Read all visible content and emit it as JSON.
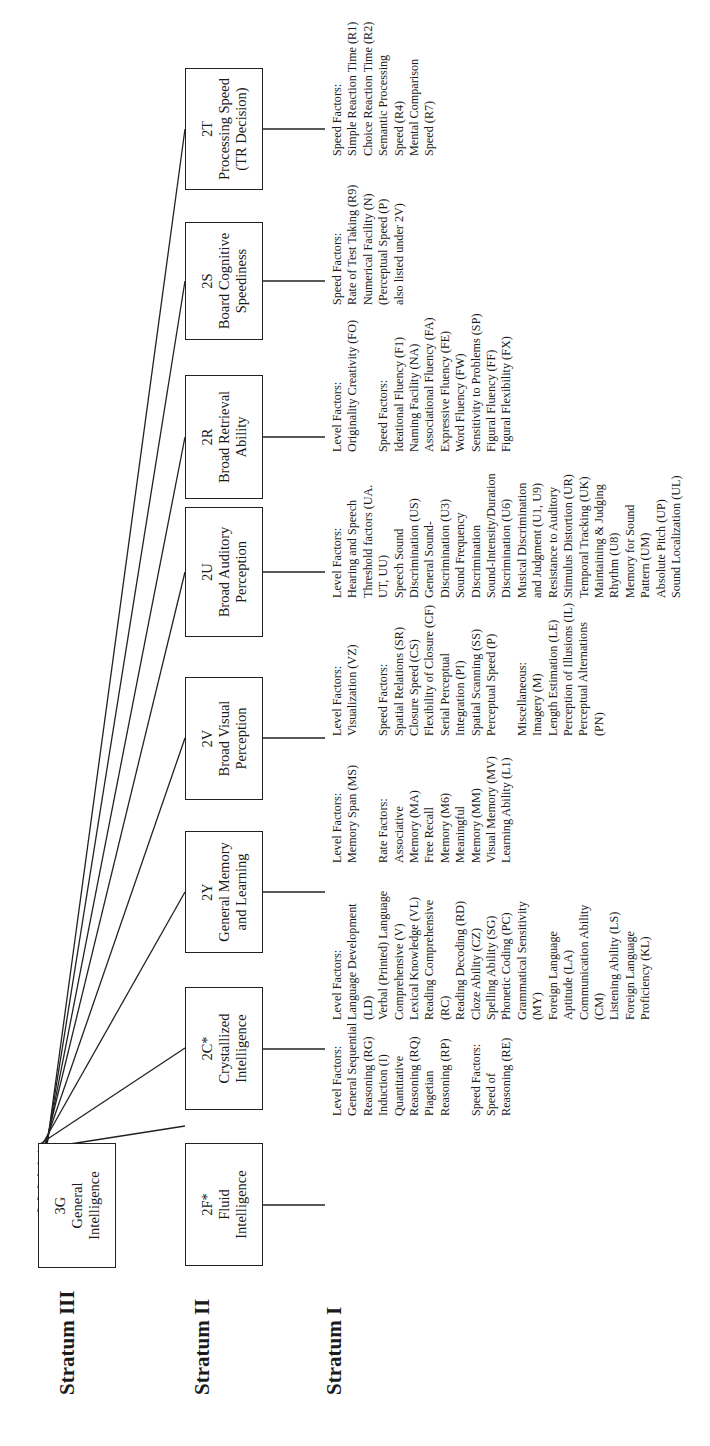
{
  "strata": {
    "stratum_3": "Stratum III",
    "stratum_2": "Stratum II",
    "stratum_1": "Stratum I"
  },
  "general": {
    "code": "3G",
    "line1": "General",
    "line2": "Intelligence"
  },
  "broad_factors": [
    {
      "code": "2F*",
      "title_lines": [
        "Fluid",
        "Intelligence"
      ],
      "groups": [
        {
          "heading": "Level Factors:",
          "lines": [
            "General Sequential",
            "Reasoning (RG)",
            "Induction (I)",
            "Quantitative",
            "Reasoning (RQ)",
            "Piagetian",
            "Reasoning (RP)"
          ]
        },
        {
          "heading": "Speed Factors:",
          "lines": [
            "Speed of",
            "Reasoning (RE)"
          ]
        }
      ]
    },
    {
      "code": "2C*",
      "title_lines": [
        "Crystallized",
        "Intelligence"
      ],
      "groups": [
        {
          "heading": "Level Factors:",
          "lines": [
            "Language Development",
            "(LD)",
            "Verbal (Printed) Language",
            "Comprehensive (V)",
            "Lexical Knowledge (VL)",
            "Reading Comprehensive",
            "(RC)",
            "Reading Decoding (RD)",
            "Cloze Ability (CZ)",
            "Spelling Ability (SG)",
            "Phonetic Coding (PC)",
            "Grammatical Sensitivity",
            "(MY)",
            "Foreign Language",
            "Aptitude  (LA)",
            "Communication Ability",
            "(CM)",
            "Listening Ability (LS)",
            "Foreign Language",
            "Proficiency (KL)"
          ]
        }
      ]
    },
    {
      "code": "2Y",
      "title_lines": [
        "General Memory",
        "and Learning"
      ],
      "groups": [
        {
          "heading": "Level Factors:",
          "lines": [
            "Memory Span (MS)"
          ]
        },
        {
          "heading": "Rate Factors:",
          "lines": [
            "Associative",
            "Memory (MA)",
            "Free Recall",
            "Memory (M6)",
            "Meaningful",
            "Memory (MM)",
            "Visual Memory (MV)",
            "Learning Ability (L1)"
          ]
        }
      ]
    },
    {
      "code": "2V",
      "title_lines": [
        "Broad Visual",
        "Perception"
      ],
      "groups": [
        {
          "heading": "Level Factors:",
          "lines": [
            "Visualization (VZ)"
          ]
        },
        {
          "heading": "Speed Factors:",
          "lines": [
            "Spatial Relations (SR)",
            "Closure Speed (CS)",
            "Flexibility of Closure (CF)",
            "Serial Perceptual",
            "Integration (PI)",
            "Spatial Scanning (SS)",
            "Perceptual Speed (P)"
          ]
        },
        {
          "heading": "Miscellaneous:",
          "lines": [
            "Imagery (M)",
            "Length Estimation (LE)",
            "Perception of Illusions (IL)",
            "Perceptual Alternations",
            "(PN)"
          ]
        }
      ]
    },
    {
      "code": "2U",
      "title_lines": [
        "Broad Auditory",
        "Perception"
      ],
      "groups": [
        {
          "heading": "Level Factors:",
          "lines": [
            "Hearing and Speech",
            "Threshold factors (UA.",
            "UT, UU)",
            "Speech Sound",
            "Discrimination (US)",
            "General Sound-",
            "Discrimination (U3)",
            "Sound Frequency",
            "Discrimination",
            "Sound-Intensity/Duration",
            "Discrimination (U6)",
            "Musical Discrimination",
            "and Judgment (U1, U9)",
            "Resistance to Auditory",
            "Stimulus Distortion (UR)",
            "Temporal Tracking (UK)",
            "Maintaining & Judging",
            "Rhythm (U8)",
            "Memory for Sound",
            "Pattern (UM)",
            "Absolute Pitch (UP)",
            "Sound Localization (UL)"
          ]
        }
      ]
    },
    {
      "code": "2R",
      "title_lines": [
        "Broad Retrieval",
        "Ability"
      ],
      "groups": [
        {
          "heading": "Level Factors:",
          "lines": [
            "Originality Creativity (FO)"
          ]
        },
        {
          "heading": "Speed Factors:",
          "lines": [
            "Ideational Fluency (F1)",
            "Naming Facility (NA)",
            "Associational Fluency (FA)",
            "Expressive Fluency (FE)",
            "Word Fluency (FW)",
            "Sensitivity to Problems (SP)",
            "Figural Fluency (FF)",
            "Figural Flexibility (FX)"
          ]
        }
      ]
    },
    {
      "code": "2S",
      "title_lines": [
        "Board Cognitive",
        "Speediness"
      ],
      "groups": [
        {
          "heading": "Speed Factors:",
          "lines": [
            "Rate of Test Taking (R9)",
            "Numerical Facility (N)",
            "(Perceptual Speed (P)",
            "also listed under 2V)"
          ]
        }
      ]
    },
    {
      "code": "2T",
      "title_lines": [
        "Processing Speed",
        "(TR Decision)"
      ],
      "groups": [
        {
          "heading": "Speed Factors:",
          "lines": [
            "Simple Reaction Time (R1)",
            "Choice Reaction Time (R2)",
            "Semantic Processing",
            "Speed (R4)",
            "Mental Comparison",
            "Speed (R7)"
          ]
        }
      ]
    }
  ],
  "colors": {
    "ink": "#1a1a1a",
    "background": "#ffffff"
  }
}
